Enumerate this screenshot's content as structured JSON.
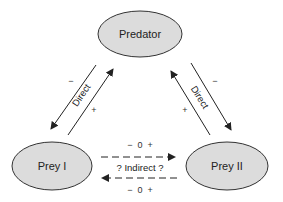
{
  "diagram": {
    "colors": {
      "node_fill": "#dcdcdc",
      "node_stroke": "#333333",
      "line": "#222222"
    },
    "nodes": {
      "predator": {
        "label": "Predator"
      },
      "prey1": {
        "label": "Prey I"
      },
      "prey2": {
        "label": "Prey II"
      }
    },
    "edges": {
      "left_direct": {
        "label": "Direct",
        "outer_sign": "−",
        "inner_sign": "+"
      },
      "right_direct": {
        "label": "Direct",
        "outer_sign": "−",
        "inner_sign": "+"
      },
      "indirect": {
        "label": "? Indirect ?",
        "top_signs": "−  0  +",
        "bottom_signs": "−  0  +"
      }
    }
  }
}
